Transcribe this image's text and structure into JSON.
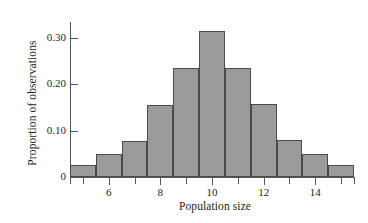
{
  "chart_data": {
    "type": "bar",
    "title": "",
    "subtitle": "",
    "xlabel": "Population size",
    "ylabel": "Proportion of observations",
    "categories": [
      5,
      6,
      7,
      8,
      9,
      10,
      11,
      12,
      13,
      14,
      15
    ],
    "values": [
      0.025,
      0.049,
      0.077,
      0.155,
      0.235,
      0.315,
      0.235,
      0.157,
      0.079,
      0.049,
      0.026
    ],
    "series": [
      {
        "name": "Proportion of observations",
        "values": [
          0.025,
          0.049,
          0.077,
          0.155,
          0.235,
          0.315,
          0.235,
          0.157,
          0.079,
          0.049,
          0.026
        ]
      }
    ],
    "xlim": [
      4.5,
      15.5
    ],
    "ylim": [
      0,
      0.335
    ],
    "xticks": [
      5,
      6,
      7,
      8,
      9,
      10,
      11,
      12,
      13,
      14,
      15
    ],
    "xtick_labels": [
      "",
      "6",
      "",
      "8",
      "",
      "10",
      "",
      "12",
      "",
      "14",
      ""
    ],
    "yticks": [
      0,
      0.1,
      0.2,
      0.3
    ],
    "ytick_labels": [
      "0",
      "0.10",
      "0.20",
      "0.30"
    ],
    "grid": false,
    "legend": false,
    "legend_position": "none",
    "bar_fill_color": "#9b9b9b",
    "bar_edge_color": "#4a4a4a",
    "axis_color": "#555555",
    "background_color": "#ffffff",
    "bin_width": 1
  }
}
